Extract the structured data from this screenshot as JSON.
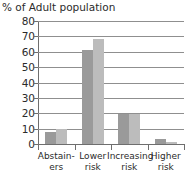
{
  "chart_data": {
    "type": "bar",
    "title": "% of Adult population",
    "xlabel": "",
    "ylabel": "",
    "ylim": [
      0,
      80
    ],
    "yticks": [
      0,
      10,
      20,
      30,
      40,
      50,
      60,
      70,
      80
    ],
    "grid": true,
    "legend": "none",
    "grouped": true,
    "categories": [
      "Abstainers",
      "Lower risk",
      "Increasing risk",
      "Higher risk"
    ],
    "category_lines": [
      [
        "Abstain-",
        "ers"
      ],
      [
        "Lower",
        "risk"
      ],
      [
        "Increasing",
        "risk"
      ],
      [
        "Higher",
        "risk"
      ]
    ],
    "series": [
      {
        "name": "series-1",
        "color": "#9a9a9a",
        "values": [
          8,
          61,
          19.5,
          3
        ]
      },
      {
        "name": "series-2",
        "color": "#bcbcbc",
        "values": [
          10,
          68.5,
          19.5,
          1
        ]
      }
    ]
  },
  "colors": {
    "series_1": "#9a9a9a",
    "series_2": "#bcbcbc",
    "gridline": "#8f8f8f",
    "axis": "#6e6e6e",
    "text": "#2b2b2b",
    "background": "#ffffff"
  }
}
